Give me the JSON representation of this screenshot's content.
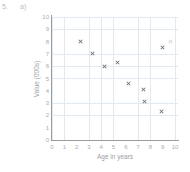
{
  "question": {
    "number": "5.",
    "part": "a)"
  },
  "chart_data": {
    "type": "scatter",
    "title": "",
    "xlabel": "Age in years",
    "ylabel": "Value (000s)",
    "xlim": [
      0,
      10
    ],
    "ylim": [
      0,
      10
    ],
    "xticks": [
      "0",
      "1",
      "2",
      "3",
      "4",
      "5",
      "6",
      "7",
      "8",
      "9",
      "10"
    ],
    "yticks": [
      "0",
      "1",
      "2",
      "3",
      "4",
      "5",
      "6",
      "7",
      "8",
      "9",
      "10"
    ],
    "grid": true,
    "legend": "none",
    "marker": "x",
    "marker_color": "#6f7479",
    "points": [
      {
        "x": 2.3,
        "y": 8.0,
        "faint": false
      },
      {
        "x": 3.3,
        "y": 7.0,
        "faint": false
      },
      {
        "x": 4.3,
        "y": 6.0,
        "faint": false
      },
      {
        "x": 5.3,
        "y": 6.3,
        "faint": false
      },
      {
        "x": 6.2,
        "y": 4.6,
        "faint": false
      },
      {
        "x": 7.4,
        "y": 4.1,
        "faint": false
      },
      {
        "x": 7.5,
        "y": 3.1,
        "faint": false
      },
      {
        "x": 8.9,
        "y": 2.3,
        "faint": false
      },
      {
        "x": 9.0,
        "y": 7.5,
        "faint": false
      },
      {
        "x": 9.6,
        "y": 8.0,
        "faint": true
      }
    ]
  }
}
